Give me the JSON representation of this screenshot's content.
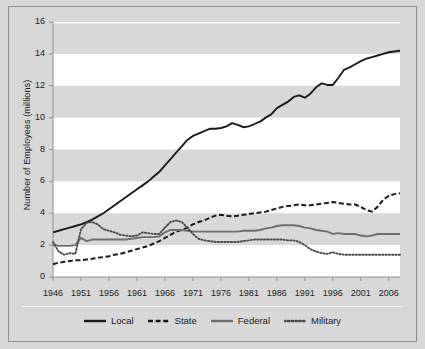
{
  "chart_data": {
    "type": "line",
    "title": "",
    "xlabel": "",
    "ylabel": "Number of Employees (millions)",
    "xlim": [
      1946,
      2008
    ],
    "ylim": [
      0,
      16
    ],
    "xticks": [
      "1946",
      "1951",
      "1956",
      "1961",
      "1966",
      "1971",
      "1976",
      "1981",
      "1986",
      "1991",
      "1996",
      "2001",
      "2006"
    ],
    "yticks": [
      "0",
      "2",
      "4",
      "6",
      "8",
      "10",
      "12",
      "14",
      "16"
    ],
    "grid": "horizontal-alternating-bands",
    "legend_position": "bottom-center",
    "x": [
      1946,
      1947,
      1948,
      1949,
      1950,
      1951,
      1952,
      1953,
      1954,
      1955,
      1956,
      1957,
      1958,
      1959,
      1960,
      1961,
      1962,
      1963,
      1964,
      1965,
      1966,
      1967,
      1968,
      1969,
      1970,
      1971,
      1972,
      1973,
      1974,
      1975,
      1976,
      1977,
      1978,
      1979,
      1980,
      1981,
      1982,
      1983,
      1984,
      1985,
      1986,
      1987,
      1988,
      1989,
      1990,
      1991,
      1992,
      1993,
      1994,
      1995,
      1996,
      1997,
      1998,
      1999,
      2000,
      2001,
      2002,
      2003,
      2004,
      2005,
      2006,
      2007,
      2008
    ],
    "series": [
      {
        "name": "Local",
        "style": "solid",
        "color": "#1a1a1a",
        "values": [
          2.8,
          2.9,
          3.0,
          3.1,
          3.2,
          3.3,
          3.45,
          3.6,
          3.8,
          4.0,
          4.25,
          4.5,
          4.75,
          5.0,
          5.25,
          5.5,
          5.75,
          6.0,
          6.3,
          6.6,
          7.0,
          7.4,
          7.8,
          8.2,
          8.6,
          8.85,
          9.0,
          9.15,
          9.3,
          9.3,
          9.35,
          9.45,
          9.65,
          9.55,
          9.4,
          9.45,
          9.6,
          9.75,
          10.0,
          10.2,
          10.6,
          10.8,
          11.0,
          11.3,
          11.4,
          11.25,
          11.5,
          11.9,
          12.15,
          12.05,
          12.05,
          12.5,
          13.0,
          13.15,
          13.35,
          13.55,
          13.7,
          13.8,
          13.9,
          14.0,
          14.1,
          14.15,
          14.2
        ]
      },
      {
        "name": "State",
        "style": "dashed",
        "color": "#1a1a1a",
        "values": [
          0.8,
          0.9,
          0.95,
          1.0,
          1.05,
          1.05,
          1.1,
          1.15,
          1.2,
          1.25,
          1.3,
          1.4,
          1.45,
          1.55,
          1.65,
          1.75,
          1.85,
          1.95,
          2.1,
          2.25,
          2.45,
          2.65,
          2.85,
          2.95,
          3.1,
          3.3,
          3.45,
          3.55,
          3.7,
          3.85,
          3.9,
          3.85,
          3.8,
          3.85,
          3.9,
          3.95,
          4.0,
          4.05,
          4.1,
          4.2,
          4.3,
          4.4,
          4.45,
          4.5,
          4.55,
          4.5,
          4.5,
          4.55,
          4.6,
          4.65,
          4.7,
          4.65,
          4.6,
          4.55,
          4.55,
          4.4,
          4.2,
          4.1,
          4.4,
          4.85,
          5.1,
          5.2,
          5.25
        ]
      },
      {
        "name": "Federal",
        "style": "solid",
        "color": "#6e6e6e",
        "values": [
          2.05,
          1.95,
          1.95,
          1.95,
          2.0,
          2.45,
          2.25,
          2.35,
          2.35,
          2.35,
          2.35,
          2.35,
          2.35,
          2.35,
          2.4,
          2.45,
          2.5,
          2.5,
          2.5,
          2.55,
          2.8,
          2.95,
          2.95,
          2.95,
          2.9,
          2.85,
          2.85,
          2.85,
          2.85,
          2.85,
          2.85,
          2.85,
          2.85,
          2.85,
          2.9,
          2.9,
          2.9,
          2.95,
          3.05,
          3.1,
          3.2,
          3.25,
          3.25,
          3.25,
          3.2,
          3.1,
          3.05,
          2.95,
          2.9,
          2.85,
          2.7,
          2.75,
          2.7,
          2.7,
          2.7,
          2.6,
          2.55,
          2.6,
          2.7,
          2.7,
          2.7,
          2.7,
          2.7
        ]
      },
      {
        "name": "Military",
        "style": "dotted",
        "color": "#4a4a4a",
        "values": [
          2.2,
          1.6,
          1.4,
          1.5,
          1.45,
          3.0,
          3.4,
          3.45,
          3.3,
          3.0,
          2.9,
          2.8,
          2.65,
          2.6,
          2.55,
          2.6,
          2.8,
          2.75,
          2.7,
          2.7,
          3.1,
          3.45,
          3.55,
          3.45,
          3.1,
          2.7,
          2.4,
          2.3,
          2.25,
          2.2,
          2.2,
          2.2,
          2.2,
          2.2,
          2.25,
          2.3,
          2.35,
          2.35,
          2.35,
          2.35,
          2.35,
          2.35,
          2.3,
          2.3,
          2.2,
          2.0,
          1.75,
          1.6,
          1.5,
          1.45,
          1.55,
          1.45,
          1.4,
          1.4,
          1.4,
          1.4,
          1.4,
          1.4,
          1.4,
          1.4,
          1.4,
          1.4,
          1.4
        ]
      }
    ]
  },
  "legend": {
    "items": [
      {
        "label": "Local"
      },
      {
        "label": "State"
      },
      {
        "label": "Federal"
      },
      {
        "label": "Military"
      }
    ]
  },
  "colors": {
    "background": "#d8d8d8",
    "band_light": "#ffffff",
    "band_dark": "#d8d8d8",
    "frame": "#8e8e8e",
    "local": "#1a1a1a",
    "state": "#1a1a1a",
    "federal": "#6e6e6e",
    "military": "#4a4a4a"
  }
}
